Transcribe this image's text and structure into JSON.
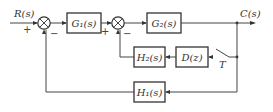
{
  "diagram": {
    "type": "block-diagram",
    "input": {
      "label": "R(s)",
      "sign": "+"
    },
    "output": {
      "label": "C(s)"
    },
    "summing_junctions": [
      {
        "id": "sum1",
        "signs": {
          "input": "+",
          "feedback": "−"
        }
      },
      {
        "id": "sum2",
        "signs": {
          "input": "+",
          "feedback": "−"
        }
      }
    ],
    "blocks": [
      {
        "id": "G1",
        "label": "G₁(s)"
      },
      {
        "id": "G2",
        "label": "G₂(s)"
      },
      {
        "id": "H2",
        "label": "H₂(s)"
      },
      {
        "id": "D",
        "label": "D(z)"
      },
      {
        "id": "H1",
        "label": "H₁(s)"
      }
    ],
    "sampler": {
      "label": "T"
    },
    "colors": {
      "line": "#444444",
      "text": "#333333",
      "background": "#ffffff"
    }
  }
}
